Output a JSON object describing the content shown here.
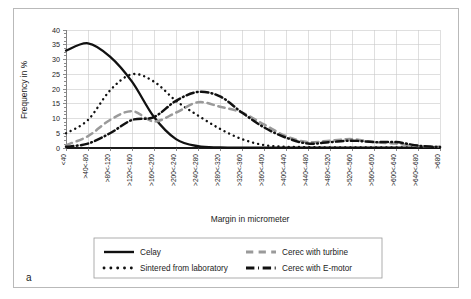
{
  "figure": {
    "panel_letter": "a"
  },
  "chart_data": {
    "type": "line",
    "title": "",
    "xlabel": "Margin in micrometer",
    "ylabel": "Frequency in %",
    "ylim": [
      0,
      40
    ],
    "yticks": [
      0,
      5,
      10,
      15,
      20,
      25,
      30,
      35,
      40
    ],
    "grid": true,
    "legend_position": "below",
    "categories": [
      "<40",
      ">40<-80",
      ">80<-120",
      ">120<-160",
      ">160<-200",
      ">200<-240",
      ">240<-280",
      ">280<-320",
      ">320<-360",
      ">360<-400",
      ">400<-440",
      ">440<-480",
      ">480<-520",
      ">520<-560",
      ">560<-600",
      ">600<-640",
      ">640<-680",
      ">680"
    ],
    "series": [
      {
        "name": "Celay",
        "style": "solid",
        "color": "#111111",
        "values": [
          33.0,
          35.5,
          31.0,
          22.5,
          10.5,
          3.0,
          0.6,
          0.2,
          0.1,
          0.1,
          0.1,
          0.1,
          0.1,
          0.1,
          0.1,
          0.1,
          0.1,
          0.1
        ]
      },
      {
        "name": "Sintered from laboratory",
        "style": "dotted",
        "color": "#111111",
        "values": [
          5.0,
          9.5,
          19.5,
          25.0,
          22.5,
          16.0,
          11.0,
          6.5,
          3.0,
          1.0,
          0.4,
          0.3,
          0.2,
          0.2,
          0.2,
          0.2,
          0.2,
          0.1
        ]
      },
      {
        "name": "Cerec with turbine",
        "style": "dashed",
        "color": "#9a9a9a",
        "values": [
          1.0,
          4.0,
          9.5,
          12.5,
          9.0,
          12.0,
          15.5,
          14.0,
          12.0,
          8.0,
          4.0,
          2.0,
          2.5,
          3.0,
          2.0,
          1.5,
          0.7,
          0.4
        ]
      },
      {
        "name": "Cerec with E-motor",
        "style": "dashdot",
        "color": "#111111",
        "values": [
          0.4,
          1.5,
          5.0,
          9.5,
          10.5,
          16.0,
          19.0,
          17.5,
          12.0,
          7.0,
          3.5,
          1.5,
          2.0,
          2.5,
          2.0,
          2.0,
          0.8,
          0.3
        ]
      }
    ]
  },
  "legend": {
    "entries": [
      {
        "label": "Celay",
        "style": "solid",
        "color": "#111111"
      },
      {
        "label": "Sintered from laboratory",
        "style": "dotted",
        "color": "#111111"
      },
      {
        "label": "Cerec with turbine",
        "style": "dashed",
        "color": "#9a9a9a"
      },
      {
        "label": "Cerec with E-motor",
        "style": "dashdot",
        "color": "#111111"
      }
    ]
  }
}
